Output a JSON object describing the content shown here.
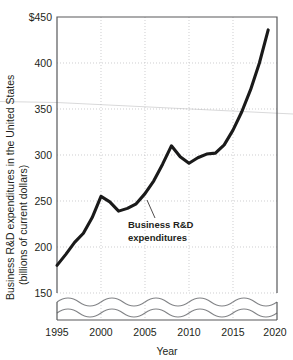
{
  "chart_data": {
    "type": "line",
    "title": "",
    "xlabel": "Year",
    "ylabel": "Business R&D expenditures in the United States (billions of current dollars)",
    "ylabel_line1": "Business R&D expenditures in the United States",
    "ylabel_line2": "(billions of current dollars)",
    "xlim": [
      1995,
      2020
    ],
    "ylim": [
      150,
      450
    ],
    "y_axis_broken_below": 150,
    "grid": true,
    "legend_position": "none",
    "y_ticks": [
      150,
      200,
      250,
      300,
      350,
      400,
      450
    ],
    "y_tick_labels": [
      "150",
      "200",
      "250",
      "300",
      "350",
      "400",
      "$450"
    ],
    "x_ticks": [
      1995,
      2000,
      2005,
      2010,
      2015,
      2020
    ],
    "x_tick_labels": [
      "1995",
      "2000",
      "2005",
      "2010",
      "2015",
      "2020"
    ],
    "series": [
      {
        "name": "Business R&D expenditures",
        "color": "#1a1a1a",
        "x": [
          1995,
          1996,
          1997,
          1998,
          1999,
          2000,
          2001,
          2002,
          2003,
          2004,
          2005,
          2006,
          2007,
          2008,
          2009,
          2010,
          2011,
          2012,
          2013,
          2014,
          2015,
          2016,
          2017,
          2018,
          2019
        ],
        "values": [
          180,
          192,
          205,
          215,
          232,
          255,
          249,
          239,
          242,
          247,
          258,
          272,
          290,
          310,
          298,
          291,
          297,
          301,
          302,
          311,
          327,
          347,
          371,
          400,
          436
        ]
      }
    ],
    "annotations": [
      {
        "text_line1": "Business R&D",
        "text_line2": "expenditures",
        "target_x": 2004,
        "target_y": 247
      }
    ]
  }
}
